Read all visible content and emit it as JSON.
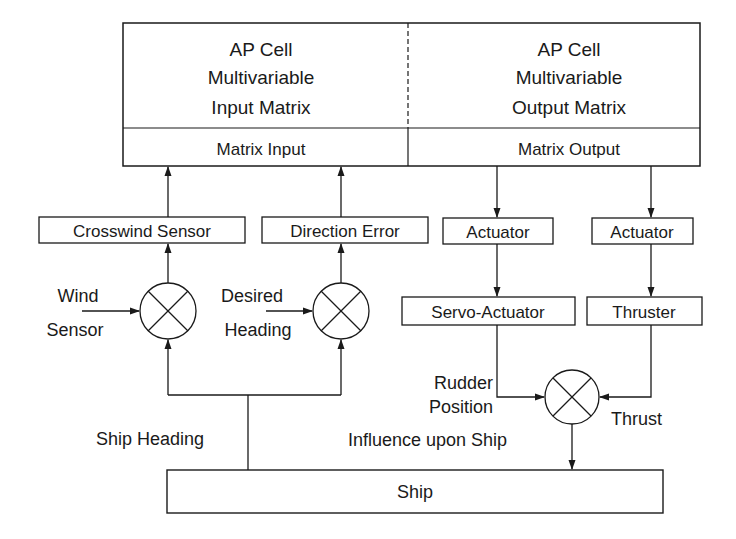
{
  "diagram": {
    "top_block": {
      "input_matrix": {
        "line1": "AP Cell",
        "line2": "Multivariable",
        "line3": "Input Matrix"
      },
      "output_matrix": {
        "line1": "AP Cell",
        "line2": "Multivariable",
        "line3": "Output Matrix"
      },
      "matrix_input_label": "Matrix Input",
      "matrix_output_label": "Matrix Output"
    },
    "blocks": {
      "crosswind_sensor": "Crosswind Sensor",
      "direction_error": "Direction Error",
      "actuator_left": "Actuator",
      "actuator_right": "Actuator",
      "servo_actuator": "Servo-Actuator",
      "thruster": "Thruster",
      "ship": "Ship"
    },
    "signals": {
      "wind_sensor_line1": "Wind",
      "wind_sensor_line2": "Sensor",
      "desired_heading_line1": "Desired",
      "desired_heading_line2": "Heading",
      "ship_heading": "Ship Heading",
      "rudder_position_line1": "Rudder",
      "rudder_position_line2": "Position",
      "thrust": "Thrust",
      "influence": "Influence upon Ship"
    },
    "colors": {
      "stroke": "#1a1a1a",
      "background": "#ffffff"
    }
  }
}
